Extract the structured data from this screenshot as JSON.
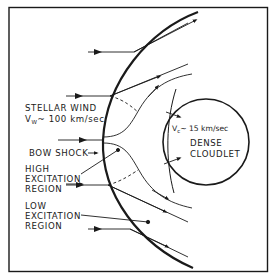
{
  "diagram": {
    "type": "astrophysical schematic",
    "labels": {
      "stellar_wind_line1": "STELLAR WIND",
      "stellar_wind_v": "V",
      "stellar_wind_v_sub": "W",
      "stellar_wind_value": "~ 100 km/sec",
      "bow_shock": "BOW SHOCK",
      "high_excitation_1": "HIGH",
      "high_excitation_2": "EXCITATION",
      "high_excitation_3": "REGION",
      "low_excitation_1": "LOW",
      "low_excitation_2": "EXCITATION",
      "low_excitation_3": "REGION",
      "cloudlet_v": "V",
      "cloudlet_v_sub": "c",
      "cloudlet_value": "~ 15 km/sec",
      "dense_1": "DENSE",
      "cloudlet_1": "CLOUDLET"
    },
    "colors": {
      "ink": "#1a1a1a",
      "background": "#ffffff"
    }
  }
}
